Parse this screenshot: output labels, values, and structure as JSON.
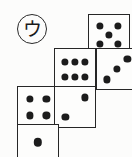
{
  "figure": {
    "kind": "dice-net-diagram",
    "label": "ウ",
    "label_style": "circled-katakana",
    "ink_color": "#262626",
    "pip_color": "#1c1c1c",
    "background_color": "#fcfcfb",
    "canvas": {
      "width": 132,
      "height": 157
    }
  },
  "faces": [
    {
      "id": "face-top-right",
      "name": "five-face",
      "value": 5,
      "x": 88,
      "y": 14,
      "size": 42,
      "clipped": false,
      "pips": [
        {
          "cx": 28,
          "cy": 28
        },
        {
          "cx": 72,
          "cy": 28
        },
        {
          "cx": 50,
          "cy": 50
        },
        {
          "cx": 28,
          "cy": 72
        },
        {
          "cx": 72,
          "cy": 72
        }
      ]
    },
    {
      "id": "face-middle-left",
      "name": "six-face",
      "value": 6,
      "x": 54,
      "y": 48,
      "size": 42,
      "clipped": false,
      "pips": [
        {
          "cx": 25,
          "cy": 33
        },
        {
          "cx": 50,
          "cy": 33
        },
        {
          "cx": 75,
          "cy": 33
        },
        {
          "cx": 25,
          "cy": 69
        },
        {
          "cx": 50,
          "cy": 69
        },
        {
          "cx": 75,
          "cy": 69
        }
      ]
    },
    {
      "id": "face-middle-right",
      "name": "three-face",
      "value": 3,
      "x": 96,
      "y": 48,
      "size": 42,
      "clipped": true,
      "pips": [
        {
          "cx": 76,
          "cy": 24
        },
        {
          "cx": 50,
          "cy": 50
        },
        {
          "cx": 24,
          "cy": 76
        }
      ]
    },
    {
      "id": "face-lower-left",
      "name": "four-face",
      "value": 4,
      "x": 17,
      "y": 86,
      "size": 42,
      "clipped": false,
      "pips": [
        {
          "cx": 29,
          "cy": 29
        },
        {
          "cx": 71,
          "cy": 29
        },
        {
          "cx": 29,
          "cy": 71
        },
        {
          "cx": 71,
          "cy": 71
        }
      ]
    },
    {
      "id": "face-lower-right",
      "name": "two-face",
      "value": 2,
      "x": 54,
      "y": 86,
      "size": 42,
      "clipped": false,
      "pips": [
        {
          "cx": 74,
          "cy": 26
        },
        {
          "cx": 26,
          "cy": 74
        }
      ]
    },
    {
      "id": "face-bottom",
      "name": "one-face",
      "value": 1,
      "x": 17,
      "y": 124,
      "size": 42,
      "clipped": true,
      "pips": [
        {
          "cx": 50,
          "cy": 43
        }
      ]
    }
  ]
}
